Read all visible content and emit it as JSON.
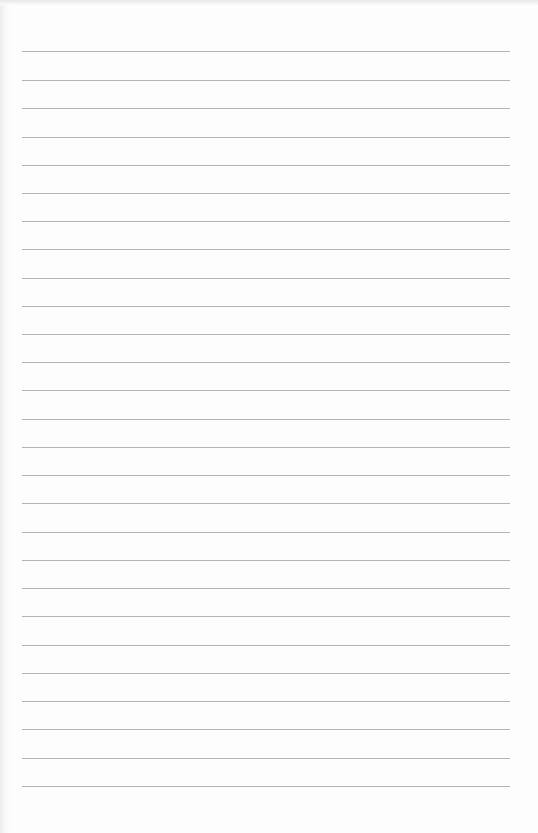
{
  "document": {
    "type": "lined-paper",
    "background_color": "#fdfdfd",
    "rule_color": "#b4b4b4",
    "rule_left": 22,
    "rule_right": 510,
    "rules_y": [
      51,
      80,
      108,
      137,
      165,
      193,
      221,
      249,
      278,
      306,
      334,
      362,
      390,
      419,
      447,
      475,
      503,
      532,
      560,
      588,
      616,
      645,
      673,
      701,
      729,
      758,
      786
    ]
  }
}
